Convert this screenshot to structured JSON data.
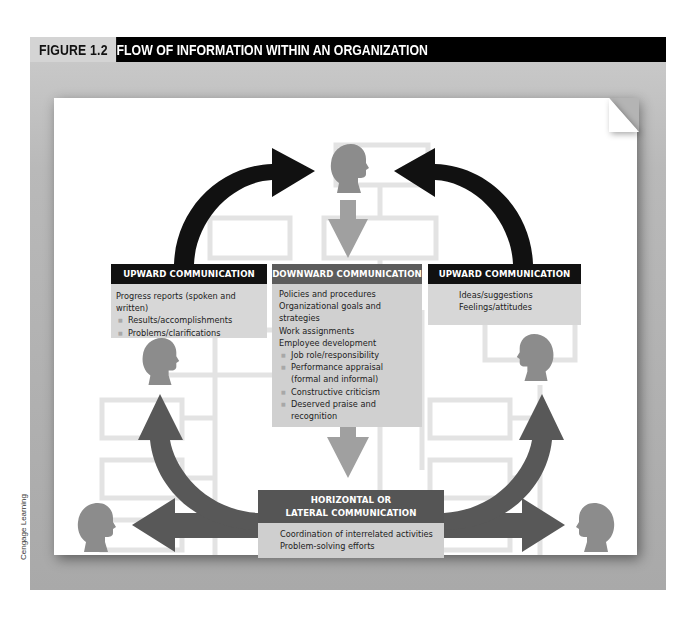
{
  "figure": {
    "label": "FIGURE 1.2",
    "title": "FLOW OF INFORMATION WITHIN AN ORGANIZATION",
    "credit": "Cengage Learning"
  },
  "colors": {
    "upward_arrow": "#111111",
    "downward_arrow": "#a0a0a0",
    "horizontal_arrow": "#585858",
    "head_silhouette": "#8c8c8c",
    "org_chart_lines": "#e2e2e2",
    "box_body": "#d7d7d7"
  },
  "boxes": {
    "upward_left": {
      "heading": "UPWARD COMMUNICATION",
      "items": [
        {
          "text": "Progress reports (spoken and written)",
          "level": 0
        },
        {
          "text": "Results/accomplishments",
          "level": 1
        },
        {
          "text": "Problems/clarifications",
          "level": 1
        }
      ]
    },
    "downward": {
      "heading": "DOWNWARD COMMUNICATION",
      "items": [
        {
          "text": "Policies and procedures",
          "level": 0
        },
        {
          "text": "Organizational goals and strategies",
          "level": 0
        },
        {
          "text": "Work assignments",
          "level": 0
        },
        {
          "text": "Employee development",
          "level": 0
        },
        {
          "text": "Job role/responsibility",
          "level": 1
        },
        {
          "text": "Performance appraisal",
          "level": 1
        },
        {
          "text": "(formal and informal)",
          "level": 2
        },
        {
          "text": "Constructive criticism",
          "level": 1
        },
        {
          "text": "Deserved praise and recognition",
          "level": 1
        }
      ]
    },
    "upward_right": {
      "heading": "UPWARD COMMUNICATION",
      "items": [
        {
          "text": "Ideas/suggestions",
          "level": 0
        },
        {
          "text": "Feelings/attitudes",
          "level": 0
        }
      ]
    },
    "horizontal": {
      "heading_line1": "HORIZONTAL OR",
      "heading_line2": "LATERAL COMMUNICATION",
      "items": [
        {
          "text": "Coordination of interrelated activities",
          "level": 0
        },
        {
          "text": "Problem-solving efforts",
          "level": 0
        }
      ]
    }
  },
  "icons": {
    "people": [
      "head-top",
      "head-left-mid",
      "head-right-mid",
      "head-bottom-left",
      "head-bottom-right"
    ],
    "arrows": [
      "upward-arrow-left",
      "upward-arrow-right",
      "downward-arrow-top",
      "downward-arrow-bottom",
      "lateral-arrow-left",
      "lateral-arrow-right",
      "lateral-up-arrow-left",
      "lateral-up-arrow-right"
    ]
  }
}
